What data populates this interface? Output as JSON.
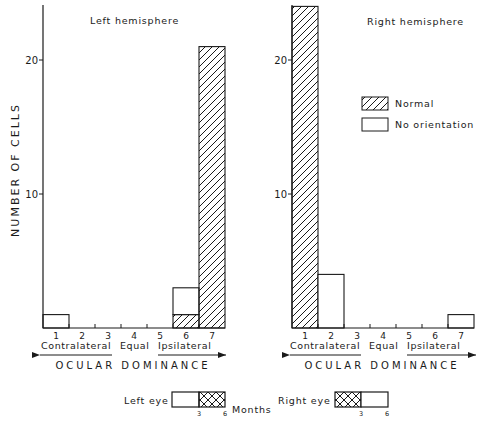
{
  "chart_data": [
    {
      "type": "bar",
      "stacked": true,
      "title": "Left hemisphere",
      "xlabel": "OCULAR DOMINANCE",
      "ylabel": "NUMBER OF CELLS",
      "categories": [
        "1",
        "2",
        "3",
        "4",
        "5",
        "6",
        "7"
      ],
      "category_groups": [
        "Contralateral",
        "Equal",
        "Ipsilateral"
      ],
      "ylim": [
        0,
        24
      ],
      "yticks": [
        10,
        20
      ],
      "series": [
        {
          "name": "Normal",
          "pattern": "hatched",
          "values": [
            0,
            0,
            0,
            0,
            0,
            1,
            21
          ]
        },
        {
          "name": "No orientation",
          "pattern": "open",
          "values": [
            1,
            0,
            0,
            0,
            0,
            2,
            0
          ]
        }
      ]
    },
    {
      "type": "bar",
      "stacked": true,
      "title": "Right hemisphere",
      "xlabel": "OCULAR DOMINANCE",
      "ylabel": "",
      "categories": [
        "1",
        "2",
        "3",
        "4",
        "5",
        "6",
        "7"
      ],
      "category_groups": [
        "Contralateral",
        "Equal",
        "Ipsilateral"
      ],
      "ylim": [
        0,
        24
      ],
      "yticks": [
        10,
        20
      ],
      "series": [
        {
          "name": "Normal",
          "pattern": "hatched",
          "values": [
            24,
            0,
            0,
            0,
            0,
            0,
            0
          ]
        },
        {
          "name": "No orientation",
          "pattern": "open",
          "values": [
            0,
            4,
            0,
            0,
            0,
            0,
            1
          ]
        }
      ]
    }
  ],
  "legend": {
    "position": "right-hemisphere-upper-right",
    "items": [
      {
        "label": "Normal",
        "pattern": "hatched"
      },
      {
        "label": "No orientation",
        "pattern": "open"
      }
    ]
  },
  "rearing": {
    "left_eye_label": "Left eye",
    "right_eye_label": "Right eye",
    "months_label": "Months",
    "tick_3": "3",
    "tick_6": "6",
    "left_eye_closed_months": [
      3,
      6
    ],
    "right_eye_closed_months": [
      0,
      3
    ]
  },
  "colors": {
    "ink": "#1a1a1a",
    "background": "#ffffff"
  }
}
